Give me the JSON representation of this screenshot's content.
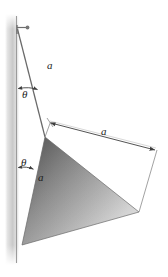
{
  "figure": {
    "kind": "mechanics-free-body-diagram",
    "background_color": "#ffffff",
    "line_color": "#4a4a4a",
    "label_color": "#1b1b1b",
    "wall": {
      "name": "vertical-wall",
      "edge_color": "#8c8c8c",
      "shade_light": "#f2f2f2",
      "shade_dark": "#b4b4b4"
    },
    "cone": {
      "name": "shaded-cone",
      "fill_dark": "#6e6e6e",
      "fill_mid": "#9a9a9a",
      "fill_light": "#d8d8d8",
      "outline_color": "#5a5a5a"
    },
    "labels": [
      {
        "id": "cord-length",
        "text": "a",
        "x": 49,
        "y": 66
      },
      {
        "id": "upper-angle",
        "text": "θ",
        "x": 24,
        "y": 90
      },
      {
        "id": "cone-height",
        "text": "a",
        "x": 40,
        "y": 178
      },
      {
        "id": "lower-angle",
        "text": "θ",
        "x": 23,
        "y": 158
      },
      {
        "id": "base-diameter",
        "text": "a",
        "x": 104,
        "y": 130
      }
    ],
    "annotations": {
      "cord_label": "a",
      "upper_angle_label": "θ",
      "lower_angle_label": "θ",
      "cone_side_label": "a",
      "base_dimension_label": "a"
    },
    "geometry": {
      "wall_x": 16,
      "wall_top": 14,
      "wall_bottom": 265,
      "anchor_point": {
        "x": 17,
        "y": 29
      },
      "cone_apex": {
        "x": 45,
        "y": 137
      },
      "cone_base_top": {
        "x": 139,
        "y": 212
      },
      "cone_base_bottom": {
        "x": 22,
        "y": 245
      },
      "dimension_start": {
        "x": 50,
        "y": 123
      },
      "dimension_end": {
        "x": 156,
        "y": 151
      }
    }
  }
}
